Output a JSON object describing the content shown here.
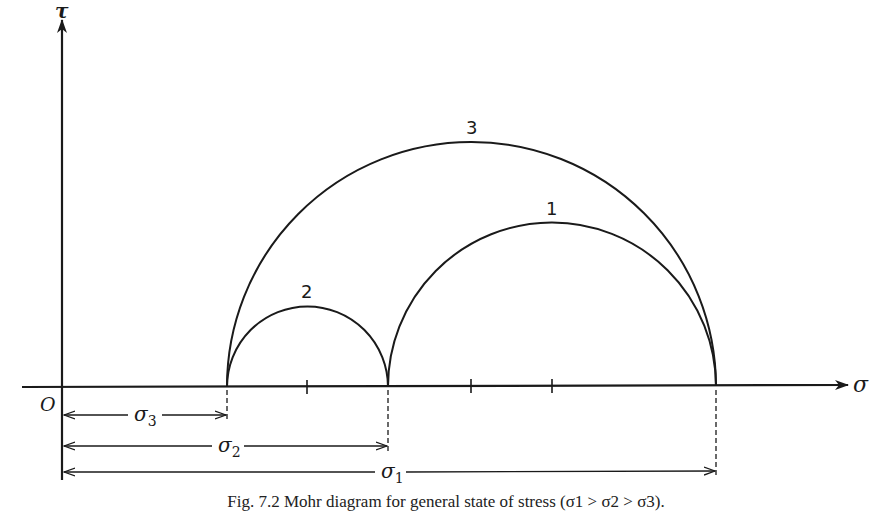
{
  "figure": {
    "axes": {
      "x_label": "σ",
      "y_label": "τ",
      "origin_label": "O"
    },
    "circles": [
      {
        "label": "1",
        "from": "σ3... σ2 to σ1",
        "left_point": "σ2",
        "right_point": "σ1"
      },
      {
        "label": "2",
        "left_point": "σ3",
        "right_point": "σ2"
      },
      {
        "label": "3",
        "left_point": "σ3",
        "right_point": "σ1"
      }
    ],
    "circle_labels": {
      "c1": "1",
      "c2": "2",
      "c3": "3"
    },
    "dimensions": {
      "sigma3": {
        "name": "σ",
        "sub": "3"
      },
      "sigma2": {
        "name": "σ",
        "sub": "2"
      },
      "sigma1": {
        "name": "σ",
        "sub": "1"
      }
    },
    "caption": "Fig. 7.2 Mohr diagram for general state of stress (σ1 > σ2 > σ3)."
  }
}
